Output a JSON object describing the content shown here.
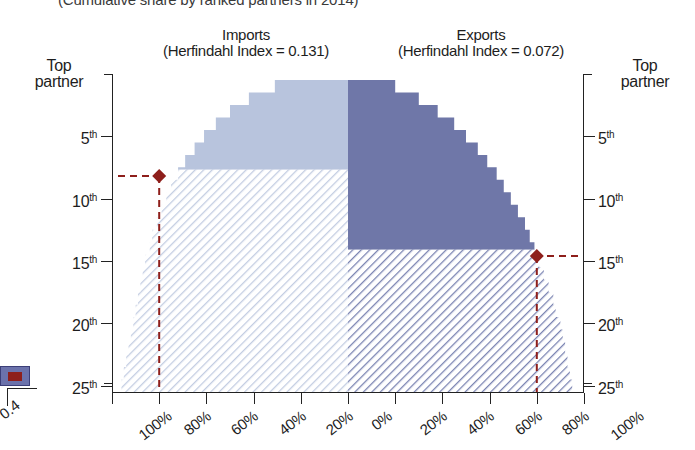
{
  "supertitle": "(Cumulative share by ranked partners in 2014)",
  "panels": {
    "imports": {
      "name": "Imports",
      "subtitle": "(Herfindahl Index = 0.131)",
      "index_label": "Herfindahl Index",
      "index_value": "0.131",
      "fill_color": "#b8c4dd",
      "hatch_color": "#dde3ef",
      "median_rank": 8.2,
      "median_share": 80
    },
    "exports": {
      "name": "Exports",
      "subtitle": "(Herfindahl Index = 0.072)",
      "index_label": "Herfindahl Index",
      "index_value": "0.072",
      "fill_color": "#6f77a8",
      "hatch_color": "#8c95bd",
      "median_rank": 14.6,
      "median_share": 80
    }
  },
  "axes": {
    "y_caption_left": {
      "line1": "Top",
      "line2": "partner"
    },
    "y_caption_right": {
      "line1": "Top",
      "line2": "partner"
    },
    "y_ticks": [
      {
        "rank": 1,
        "label": "Top partner",
        "suffix": ""
      },
      {
        "rank": 5,
        "label": "5",
        "suffix": "th"
      },
      {
        "rank": 10,
        "label": "10",
        "suffix": "th"
      },
      {
        "rank": 15,
        "label": "15",
        "suffix": "th"
      },
      {
        "rank": 20,
        "label": "20",
        "suffix": "th"
      },
      {
        "rank": 25,
        "label": "25",
        "suffix": "th"
      }
    ],
    "x_ticks_left": [
      "100%",
      "80%",
      "60%",
      "40%",
      "20%",
      "0%"
    ],
    "x_ticks_right": [
      "0%",
      "20%",
      "40%",
      "60%",
      "80%",
      "100%"
    ],
    "x_range": [
      0,
      100
    ],
    "y_range": [
      1,
      25
    ]
  },
  "marker": {
    "color": "#8e1f1b",
    "shape": "diamond",
    "leader_style": "dashed"
  },
  "fragment": {
    "label": "0.4",
    "swatch_color": "#6b72ab",
    "swatch_inner_color": "#8e1f1b"
  },
  "chart_data": {
    "type": "area",
    "title": "(Cumulative share by ranked partners in 2014)",
    "xlabel": "Cumulative share",
    "ylabel": "Partner rank",
    "xlim": [
      0,
      100
    ],
    "ylim": [
      1,
      25
    ],
    "grid": false,
    "legend": "none",
    "orientation": "back-to-back mirrored step area",
    "categories": [
      1,
      2,
      3,
      4,
      5,
      6,
      7,
      8,
      9,
      10,
      11,
      12,
      13,
      14,
      15,
      16,
      17,
      18,
      19,
      20,
      21,
      22,
      23,
      24,
      25
    ],
    "series": [
      {
        "name": "Imports",
        "direction": "left",
        "herfindahl_index": 0.131,
        "values": [
          31,
          42,
          50,
          56,
          61,
          65,
          69,
          72,
          75,
          77,
          79,
          81,
          83,
          84,
          86,
          87,
          88,
          89,
          90,
          91,
          92,
          93,
          94,
          95,
          96
        ]
      },
      {
        "name": "Exports",
        "direction": "right",
        "herfindahl_index": 0.072,
        "values": [
          20,
          30,
          38,
          45,
          50,
          55,
          59,
          63,
          66,
          69,
          72,
          75,
          77,
          79,
          81,
          83,
          85,
          87,
          88,
          90,
          91,
          92,
          93,
          94,
          95
        ]
      }
    ],
    "annotations": [
      {
        "series": "Imports",
        "label": "median partner",
        "rank": 8.2,
        "share": 80
      },
      {
        "series": "Exports",
        "label": "median partner",
        "rank": 14.6,
        "share": 80
      }
    ]
  }
}
